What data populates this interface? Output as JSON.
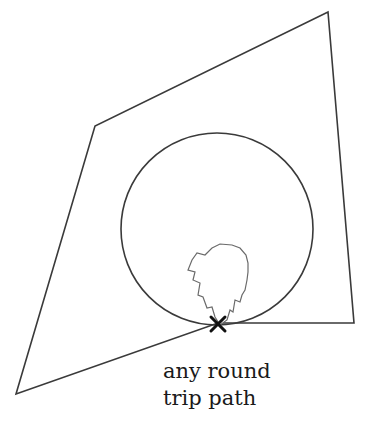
{
  "diagram": {
    "stroke_color": "#3a3a3a",
    "cross_color": "#111111",
    "background": "#ffffff",
    "polygon_points": "328,12 354,323 218,323 16,394 95,126",
    "circle": {
      "cx": 217,
      "cy": 229,
      "r": 96
    },
    "flame_points": "212,248 220,244 232,245 240,248 246,255 248,263 248,272 247,280 245,290 242,295 240,302 235,300 233,312 230,310 227,320 220,325 215,317 212,307 207,308 203,297 198,295 200,283 193,280 195,272 188,270 192,260 197,253 205,255",
    "cross": {
      "x": 218,
      "y": 324,
      "size": 7
    },
    "label": {
      "line1": "any round",
      "line2": "trip path"
    }
  }
}
